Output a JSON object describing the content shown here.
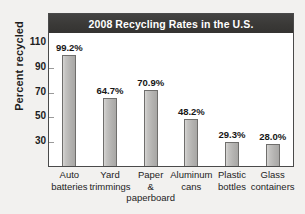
{
  "chart_data": {
    "type": "bar",
    "title": "2008 Recycling Rates in the U.S.",
    "xlabel": "",
    "ylabel": "Percent recycled",
    "ylim": [
      10,
      118
    ],
    "yticks": [
      110,
      90,
      70,
      50,
      30
    ],
    "grid": false,
    "legend": "none",
    "categories": [
      "Auto\nbatteries",
      "Yard\ntrimmings",
      "Paper\n&\npaperboard",
      "Aluminum\ncans",
      "Plastic\nbottles",
      "Glass\ncontainers"
    ],
    "values": [
      99.2,
      64.7,
      70.9,
      48.2,
      29.3,
      28.0
    ],
    "value_labels": [
      "99.2%",
      "64.7%",
      "70.9%",
      "48.2%",
      "29.3%",
      "28.0%"
    ],
    "colors": {
      "bar_fill": "#b4b3b1",
      "bar_edge": "#6f6e6c",
      "title_bar": "#3a3937",
      "title_text": "#ffffff",
      "plot_background": "#ffffff",
      "figure_background": "#f2f1ef",
      "axis": "#4a4a4a",
      "text": "#1d1d1d"
    }
  }
}
